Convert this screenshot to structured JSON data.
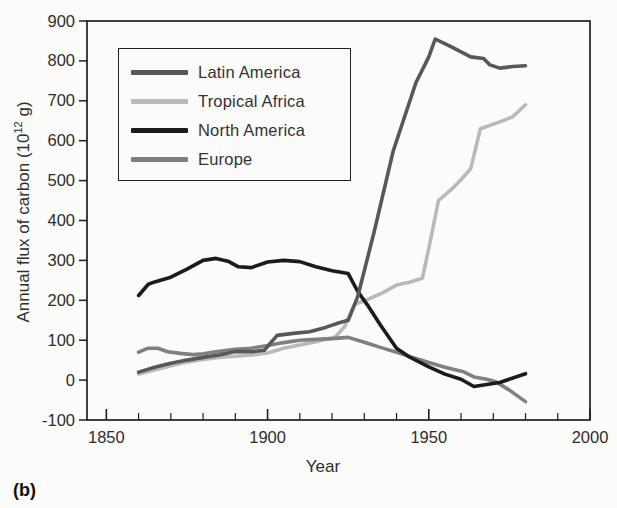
{
  "figure_label": "(b)",
  "chart_data": {
    "type": "line",
    "title": "",
    "xlabel": "Year",
    "ylabel_prefix": "Annual flux of carbon (10",
    "ylabel_sup": "12",
    "ylabel_suffix": " g)",
    "xlim": [
      1844,
      2000
    ],
    "ylim": [
      -100,
      900
    ],
    "x_ticks_major": [
      1850,
      1900,
      1950,
      2000
    ],
    "x_tick_minor_step": 10,
    "y_ticks": [
      -100,
      0,
      100,
      200,
      300,
      400,
      500,
      600,
      700,
      800,
      900
    ],
    "grid": false,
    "legend_position": "upper-left",
    "background_color": "#fbfbf9",
    "axis_color": "#1f1f1f",
    "text_color": "#2e2e2e",
    "draw_order": [
      1,
      3,
      2,
      0
    ],
    "series": [
      {
        "name": "Latin America",
        "color": "#585858",
        "points": [
          [
            1860,
            20
          ],
          [
            1865,
            32
          ],
          [
            1870,
            42
          ],
          [
            1875,
            50
          ],
          [
            1880,
            57
          ],
          [
            1885,
            63
          ],
          [
            1890,
            72
          ],
          [
            1895,
            71
          ],
          [
            1899,
            75
          ],
          [
            1903,
            112
          ],
          [
            1908,
            117
          ],
          [
            1913,
            121
          ],
          [
            1918,
            132
          ],
          [
            1922,
            143
          ],
          [
            1925,
            150
          ],
          [
            1928,
            210
          ],
          [
            1933,
            370
          ],
          [
            1939,
            575
          ],
          [
            1946,
            745
          ],
          [
            1950,
            810
          ],
          [
            1952,
            855
          ],
          [
            1957,
            835
          ],
          [
            1963,
            810
          ],
          [
            1967,
            806
          ],
          [
            1969,
            790
          ],
          [
            1972,
            782
          ],
          [
            1976,
            786
          ],
          [
            1980,
            788
          ]
        ]
      },
      {
        "name": "Tropical Africa",
        "color": "#b9b9b9",
        "points": [
          [
            1860,
            15
          ],
          [
            1865,
            25
          ],
          [
            1870,
            36
          ],
          [
            1875,
            45
          ],
          [
            1880,
            52
          ],
          [
            1885,
            57
          ],
          [
            1890,
            60
          ],
          [
            1895,
            63
          ],
          [
            1900,
            68
          ],
          [
            1905,
            80
          ],
          [
            1910,
            88
          ],
          [
            1915,
            96
          ],
          [
            1921,
            108
          ],
          [
            1924,
            135
          ],
          [
            1927,
            190
          ],
          [
            1931,
            202
          ],
          [
            1936,
            220
          ],
          [
            1940,
            238
          ],
          [
            1944,
            245
          ],
          [
            1948,
            255
          ],
          [
            1950,
            330
          ],
          [
            1953,
            450
          ],
          [
            1957,
            478
          ],
          [
            1960,
            502
          ],
          [
            1963,
            530
          ],
          [
            1966,
            630
          ],
          [
            1972,
            647
          ],
          [
            1976,
            660
          ],
          [
            1980,
            690
          ]
        ]
      },
      {
        "name": "North America",
        "color": "#1b1b1b",
        "points": [
          [
            1860,
            212
          ],
          [
            1863,
            240
          ],
          [
            1865,
            246
          ],
          [
            1870,
            258
          ],
          [
            1875,
            278
          ],
          [
            1880,
            300
          ],
          [
            1884,
            305
          ],
          [
            1888,
            297
          ],
          [
            1891,
            284
          ],
          [
            1895,
            282
          ],
          [
            1900,
            296
          ],
          [
            1905,
            300
          ],
          [
            1910,
            297
          ],
          [
            1915,
            284
          ],
          [
            1920,
            274
          ],
          [
            1925,
            267
          ],
          [
            1928,
            222
          ],
          [
            1931,
            188
          ],
          [
            1935,
            138
          ],
          [
            1940,
            80
          ],
          [
            1944,
            58
          ],
          [
            1950,
            33
          ],
          [
            1955,
            15
          ],
          [
            1960,
            2
          ],
          [
            1964,
            -16
          ],
          [
            1972,
            -6
          ],
          [
            1980,
            16
          ]
        ]
      },
      {
        "name": "Europe",
        "color": "#808080",
        "points": [
          [
            1860,
            70
          ],
          [
            1863,
            80
          ],
          [
            1866,
            80
          ],
          [
            1869,
            71
          ],
          [
            1873,
            67
          ],
          [
            1877,
            64
          ],
          [
            1880,
            66
          ],
          [
            1885,
            72
          ],
          [
            1890,
            77
          ],
          [
            1895,
            80
          ],
          [
            1900,
            87
          ],
          [
            1905,
            94
          ],
          [
            1910,
            100
          ],
          [
            1915,
            102
          ],
          [
            1920,
            104
          ],
          [
            1925,
            107
          ],
          [
            1930,
            95
          ],
          [
            1935,
            82
          ],
          [
            1940,
            70
          ],
          [
            1945,
            57
          ],
          [
            1950,
            44
          ],
          [
            1955,
            32
          ],
          [
            1961,
            20
          ],
          [
            1964,
            8
          ],
          [
            1968,
            2
          ],
          [
            1971,
            -5
          ],
          [
            1975,
            -25
          ],
          [
            1980,
            -54
          ]
        ]
      }
    ]
  }
}
